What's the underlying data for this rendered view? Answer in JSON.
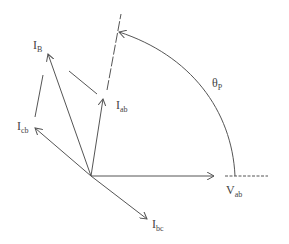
{
  "diagram": {
    "type": "phasor-diagram",
    "stroke_color": "#555555",
    "labels": {
      "i_b": {
        "main": "I",
        "sub": "B"
      },
      "i_ab": {
        "main": "I",
        "sub": "ab"
      },
      "i_cb": {
        "main": "I",
        "sub": "cb"
      },
      "i_bc": {
        "main": "I",
        "sub": "bc"
      },
      "v_ab": {
        "main": "V",
        "sub": "ab"
      },
      "theta_p": {
        "main": "θ",
        "sub": "P"
      }
    },
    "phasors": [
      {
        "name": "V_ab",
        "from": [
          91,
          176
        ],
        "to": [
          214,
          176
        ]
      },
      {
        "name": "I_ab",
        "from": [
          91,
          176
        ],
        "to": [
          103,
          99
        ]
      },
      {
        "name": "I_B",
        "from": [
          91,
          176
        ],
        "to": [
          48,
          54
        ]
      },
      {
        "name": "I_cb",
        "from": [
          91,
          176
        ],
        "to": [
          35,
          128
        ]
      },
      {
        "name": "I_bc",
        "from": [
          91,
          176
        ],
        "to": [
          147,
          219
        ]
      }
    ],
    "angle_arc": {
      "label": "θ_P",
      "from_axis": "V_ab reference",
      "to_axis": "I_ab extension"
    }
  }
}
